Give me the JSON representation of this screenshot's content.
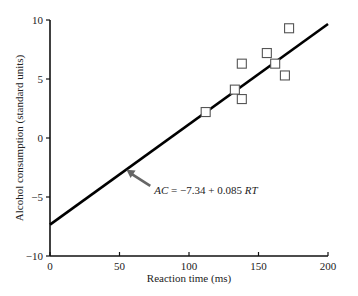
{
  "chart_data": {
    "type": "scatter",
    "title": "",
    "xlabel": "Reaction time (ms)",
    "ylabel": "Alcohol consumption (standard units)",
    "xlim": [
      0,
      200
    ],
    "ylim": [
      -10,
      10
    ],
    "x_ticks": [
      0,
      50,
      100,
      150,
      200
    ],
    "y_ticks": [
      -10,
      -5,
      0,
      5,
      10
    ],
    "x_tick_labels": [
      "0",
      "50",
      "100",
      "150",
      "200"
    ],
    "y_tick_labels": [
      "−10",
      "−5",
      "0",
      "5",
      "10"
    ],
    "grid": false,
    "legend": null,
    "series": [
      {
        "name": "Observations",
        "marker": "open-square",
        "points": [
          {
            "x": 112,
            "y": 2.2
          },
          {
            "x": 133,
            "y": 4.1
          },
          {
            "x": 138,
            "y": 6.3
          },
          {
            "x": 138,
            "y": 3.3
          },
          {
            "x": 156,
            "y": 7.2
          },
          {
            "x": 162,
            "y": 6.3
          },
          {
            "x": 169,
            "y": 5.3
          },
          {
            "x": 172,
            "y": 9.3
          }
        ]
      },
      {
        "name": "Regression line",
        "type": "line",
        "intercept": -7.34,
        "slope": 0.085,
        "x_range": [
          0,
          200
        ]
      }
    ],
    "annotations": [
      {
        "text_parts": [
          "AC",
          " = −7.34 + 0.085 ",
          "RT"
        ],
        "arrow_to": {
          "x": 55,
          "y": -2.7
        },
        "text_at": {
          "x": 75,
          "y": -4.4
        }
      }
    ]
  },
  "labels": {
    "xlabel": "Reaction time (ms)",
    "ylabel": "Alcohol consumption (standard units)",
    "eq_ac": "AC",
    "eq_mid": " = −7.34 + 0.085 ",
    "eq_rt": "RT"
  },
  "colors": {
    "axis": "#111111",
    "line": "#000000",
    "marker": "#555555",
    "arrow": "#666666"
  }
}
